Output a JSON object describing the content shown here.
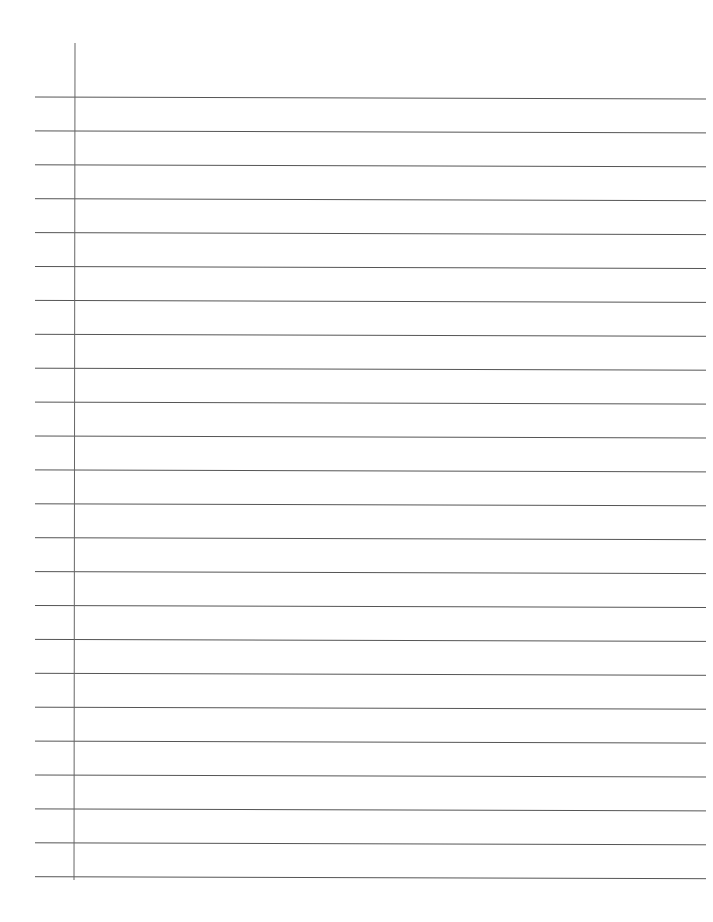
{
  "page": {
    "type": "lined-paper",
    "background_color": "#ffffff",
    "line_color": "#555555",
    "margin_line_color": "#666666",
    "line_count": 24,
    "first_line_y": 97,
    "line_spacing": 33.9,
    "line_x_start": 35,
    "line_x_end": 706,
    "line_slope_px": 2,
    "margin_line": {
      "x_top": 75,
      "x_bottom": 74,
      "y_top": 43,
      "y_bottom": 880
    },
    "text": []
  }
}
